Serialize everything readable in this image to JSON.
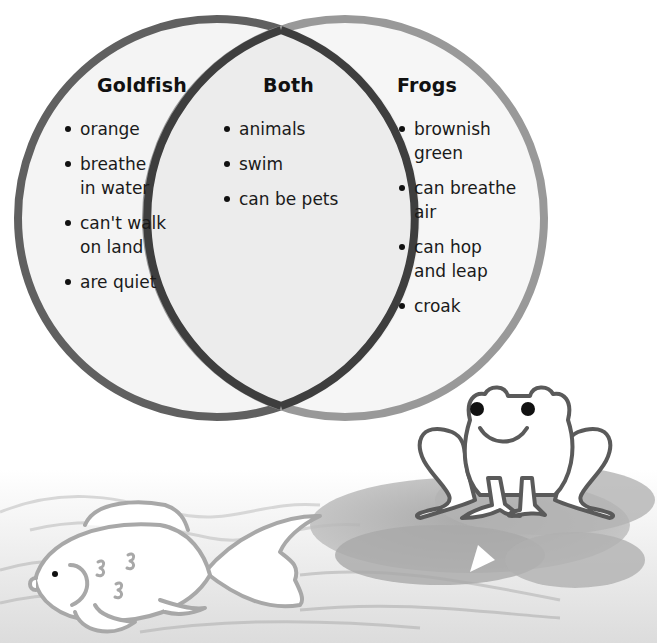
{
  "diagram": {
    "type": "venn",
    "sets": [
      {
        "id": "goldfish",
        "heading": "Goldfish",
        "items": [
          [
            "orange"
          ],
          [
            "breathe",
            "in water"
          ],
          [
            "can't walk",
            "on land"
          ],
          [
            "are quiet"
          ]
        ]
      },
      {
        "id": "both",
        "heading": "Both",
        "items": [
          [
            "animals"
          ],
          [
            "swim"
          ],
          [
            "can be pets"
          ]
        ]
      },
      {
        "id": "frogs",
        "heading": "Frogs",
        "items": [
          [
            "brownish",
            "green"
          ],
          [
            "can breathe",
            "air"
          ],
          [
            "can hop",
            "and leap"
          ],
          [
            "croak"
          ]
        ]
      }
    ],
    "colors": {
      "left_circle_stroke": "#5f5f5f",
      "right_circle_stroke": "#9a9a9a",
      "overlap_stroke": "#3a3a3a",
      "fill": "#f3f3f3",
      "lily_pad": "#a8a8a8",
      "water_lines": "#c8c8c8"
    }
  },
  "illustrations": {
    "left": "goldfish",
    "right": "frog-on-lily-pad"
  }
}
